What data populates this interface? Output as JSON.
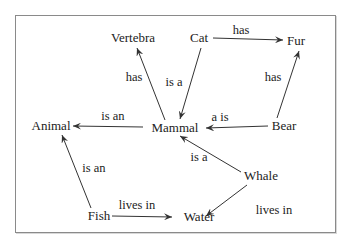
{
  "diagram": {
    "type": "semantic-network",
    "nodes": [
      {
        "id": "vertebra",
        "label": "Vertebra",
        "x": 133,
        "y": 42
      },
      {
        "id": "cat",
        "label": "Cat",
        "x": 199,
        "y": 42
      },
      {
        "id": "fur",
        "label": "Fur",
        "x": 296,
        "y": 45
      },
      {
        "id": "animal",
        "label": "Animal",
        "x": 51,
        "y": 130
      },
      {
        "id": "mammal",
        "label": "Mammal",
        "x": 175,
        "y": 132
      },
      {
        "id": "bear",
        "label": "Bear",
        "x": 284,
        "y": 130
      },
      {
        "id": "whale",
        "label": "Whale",
        "x": 261,
        "y": 180
      },
      {
        "id": "fish",
        "label": "Fish",
        "x": 99,
        "y": 220
      },
      {
        "id": "water",
        "label": "Water",
        "x": 199,
        "y": 221
      }
    ],
    "edges": [
      {
        "from": "cat",
        "to": "fur",
        "label": "has"
      },
      {
        "from": "mammal",
        "to": "vertebra",
        "label": "has"
      },
      {
        "from": "cat",
        "to": "mammal",
        "label": "is a"
      },
      {
        "from": "bear",
        "to": "fur",
        "label": "has"
      },
      {
        "from": "mammal",
        "to": "animal",
        "label": "is an"
      },
      {
        "from": "bear",
        "to": "mammal",
        "label": "a is"
      },
      {
        "from": "whale",
        "to": "mammal",
        "label": "is a"
      },
      {
        "from": "fish",
        "to": "animal",
        "label": "is an"
      },
      {
        "from": "fish",
        "to": "water",
        "label": "lives in"
      },
      {
        "from": "whale",
        "to": "water",
        "label": "lives in"
      }
    ],
    "colors": {
      "line": "#333333",
      "text": "#222222",
      "frame": "#8a8a8a",
      "background": "#ffffff"
    }
  }
}
